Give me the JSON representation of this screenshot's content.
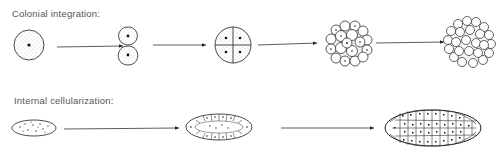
{
  "diagram": {
    "rows": [
      {
        "label": "Colonial integration:",
        "stages": [
          {
            "name": "single-cell",
            "description": "single cell with one nucleus"
          },
          {
            "name": "two-cell",
            "description": "two cells after first division"
          },
          {
            "name": "four-cell",
            "description": "four cells with four nuclei"
          },
          {
            "name": "multicell-colony",
            "description": "colony of many cells"
          },
          {
            "name": "integrated-colony",
            "description": "large integrated multicellular mass"
          }
        ]
      },
      {
        "label": "Internal cellularization:",
        "stages": [
          {
            "name": "multinucleate-cell",
            "description": "elongated cell with many scattered nuclei"
          },
          {
            "name": "partially-cellularized",
            "description": "peripheral cell walls forming"
          },
          {
            "name": "fully-cellularized",
            "description": "fully partitioned multicellular body"
          }
        ]
      }
    ],
    "colors": {
      "ink": "#222222",
      "stipple": "#9a9a9a",
      "label": "#555555",
      "background": "#ffffff"
    }
  }
}
